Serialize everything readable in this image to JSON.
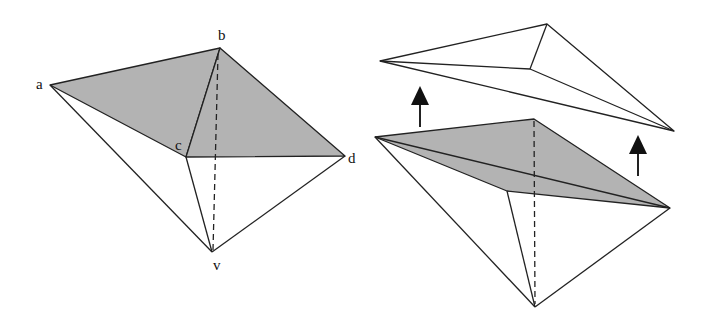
{
  "diagram": {
    "colors": {
      "fill": "#b3b3b3",
      "stroke": "#222222",
      "background": "#ffffff"
    },
    "left_figure": {
      "labels": {
        "a": "a",
        "b": "b",
        "c": "c",
        "d": "d",
        "v": "v"
      },
      "vertices": {
        "a": [
          50,
          85
        ],
        "b": [
          220,
          48
        ],
        "c": [
          186,
          157
        ],
        "d": [
          345,
          156
        ],
        "v": [
          212,
          252
        ]
      },
      "shaded_faces": [
        [
          "a",
          "b",
          "c"
        ],
        [
          "c",
          "b",
          "d"
        ]
      ],
      "hidden_edges": [
        [
          "b",
          "v"
        ]
      ]
    },
    "right_figure": {
      "top_piece": {
        "left": [
          380,
          61
        ],
        "top": [
          547,
          24
        ],
        "inner": [
          530,
          69
        ],
        "right": [
          674,
          131
        ]
      },
      "bottom_piece": {
        "left": [
          375,
          137
        ],
        "top": [
          534,
          119
        ],
        "inner": [
          507,
          191
        ],
        "right": [
          670,
          208
        ],
        "apex": [
          535,
          307
        ]
      },
      "arrows": [
        {
          "name": "lift-arrow-left",
          "x": 420,
          "y_from": 127,
          "y_to": 85
        },
        {
          "name": "lift-arrow-right",
          "x": 638,
          "y_from": 176,
          "y_to": 134
        }
      ]
    }
  }
}
